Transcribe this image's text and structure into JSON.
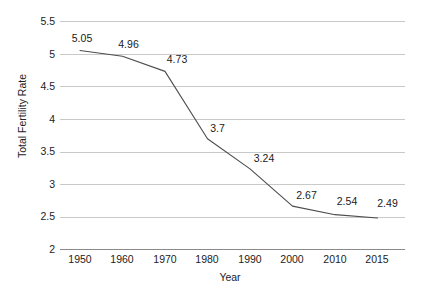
{
  "chart_data": {
    "type": "line",
    "title": "",
    "xlabel": "Year",
    "ylabel": "Total Fertility Rate",
    "categories": [
      "1950",
      "1960",
      "1970",
      "1980",
      "1990",
      "2000",
      "2010",
      "2015"
    ],
    "values": [
      5.05,
      4.96,
      4.73,
      3.7,
      3.24,
      2.67,
      2.54,
      2.49
    ],
    "point_labels": [
      "5.05",
      "4.96",
      "4.73",
      "3.7",
      "3.24",
      "2.67",
      "2.54",
      "2.49"
    ],
    "ylim": [
      2,
      5.5
    ],
    "yticks": [
      5.5,
      5,
      4.5,
      4,
      3.5,
      3,
      2.5,
      2
    ],
    "ytick_labels": [
      "5.5",
      "5",
      "4.5",
      "4",
      "3.5",
      "3",
      "2.5",
      "2"
    ],
    "grid": true,
    "legend": "none",
    "series_color": "#4d4d4d",
    "grid_color": "#c9c9c9",
    "axis_color": "#8a8a8a",
    "background": "#ffffff",
    "series": [
      {
        "name": "Total Fertility Rate",
        "values": [
          5.05,
          4.96,
          4.73,
          3.7,
          3.24,
          2.67,
          2.54,
          2.49
        ]
      }
    ]
  }
}
